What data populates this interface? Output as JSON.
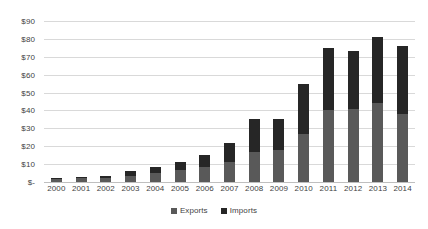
{
  "chart_data": {
    "type": "bar",
    "subtype": "stacked",
    "title": "",
    "xlabel": "",
    "ylabel": "",
    "categories": [
      "2000",
      "2001",
      "2002",
      "2003",
      "2004",
      "2005",
      "2006",
      "2007",
      "2008",
      "2009",
      "2010",
      "2011",
      "2012",
      "2013",
      "2014"
    ],
    "series": [
      {
        "name": "Exports",
        "color": "#595959",
        "values": [
          1.5,
          2.0,
          2.2,
          3.5,
          5.0,
          6.5,
          8.5,
          11.0,
          17.0,
          18.0,
          27.0,
          40.0,
          41.0,
          44.0,
          38.0
        ]
      },
      {
        "name": "Imports",
        "color": "#262626",
        "values": [
          0.8,
          1.0,
          1.3,
          2.5,
          3.5,
          4.5,
          6.5,
          11.0,
          18.0,
          17.0,
          28.0,
          35.0,
          32.0,
          37.0,
          38.0
        ]
      }
    ],
    "totals": [
      2.3,
      3.0,
      3.5,
      6.0,
      8.5,
      11.0,
      15.0,
      22.0,
      35.0,
      35.0,
      55.0,
      75.0,
      73.0,
      81.0,
      76.0
    ],
    "ylim": [
      0,
      90
    ],
    "y_ticks": [
      0,
      10,
      20,
      30,
      40,
      50,
      60,
      70,
      80,
      90
    ],
    "y_tick_labels": [
      "$-",
      "$10",
      "$20",
      "$30",
      "$40",
      "$50",
      "$60",
      "$70",
      "$80",
      "$90"
    ],
    "grid": true,
    "legend_position": "bottom",
    "legend": [
      {
        "label": "Exports",
        "color": "#595959"
      },
      {
        "label": "Imports",
        "color": "#262626"
      }
    ]
  },
  "colors": {
    "gridline": "#d9d9d9",
    "baseline": "#bfbfbf",
    "text": "#3f3f3f",
    "background": "#ffffff"
  }
}
